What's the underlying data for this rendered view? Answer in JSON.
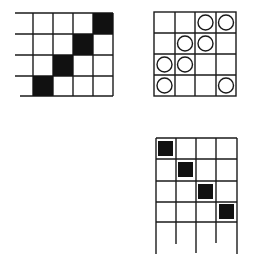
{
  "figure": {
    "colors": {
      "line": "#1a1a1a",
      "fill": "#111111",
      "background": "#ffffff"
    },
    "grids": [
      {
        "id": "grid-diagonal-filled",
        "rows": 4,
        "cols": 4,
        "filled_cells": [
          [
            0,
            3
          ],
          [
            1,
            2
          ],
          [
            2,
            1
          ],
          [
            3,
            0
          ]
        ],
        "style": "full-fill"
      },
      {
        "id": "grid-circles",
        "rows": 4,
        "cols": 4,
        "circle_cells": [
          [
            0,
            2
          ],
          [
            0,
            3
          ],
          [
            1,
            1
          ],
          [
            1,
            2
          ],
          [
            2,
            0
          ],
          [
            2,
            1
          ],
          [
            3,
            0
          ],
          [
            3,
            3
          ]
        ],
        "style": "circles"
      },
      {
        "id": "grid-diagonal-inset",
        "rows": 4,
        "cols": 4,
        "filled_cells": [
          [
            0,
            0
          ],
          [
            1,
            1
          ],
          [
            2,
            2
          ],
          [
            3,
            3
          ]
        ],
        "style": "inset-squares",
        "open_bottom": true
      }
    ]
  }
}
